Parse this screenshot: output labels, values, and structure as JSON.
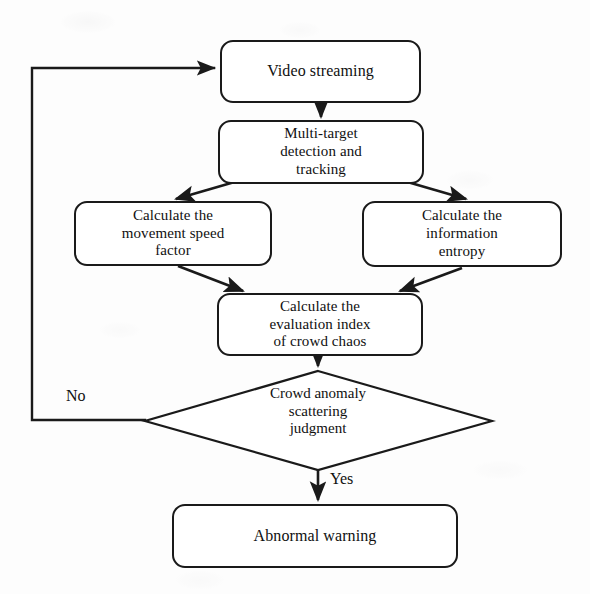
{
  "figure": {
    "type": "flowchart",
    "orientation": "top-to-bottom",
    "background_color": "#fdfdfd",
    "line_color": "#1a1a1a",
    "text_color": "#101010"
  },
  "nodes": {
    "video_streaming": {
      "label": "Video streaming",
      "shape": "rounded-rectangle",
      "font_size": "16px"
    },
    "multi_target": {
      "label": "Multi-target\ndetection and\ntracking",
      "shape": "rounded-rectangle",
      "font_size": "15px"
    },
    "movement_speed": {
      "label": "Calculate the\nmovement speed\nfactor",
      "shape": "rounded-rectangle",
      "font_size": "15px"
    },
    "information_entropy": {
      "label": "Calculate the\ninformation\nentropy",
      "shape": "rounded-rectangle",
      "font_size": "15px"
    },
    "evaluation_index": {
      "label": "Calculate the\nevaluation index\nof crowd chaos",
      "shape": "rounded-rectangle",
      "font_size": "15px"
    },
    "decision": {
      "label": "Crowd anomaly\nscattering\njudgment",
      "shape": "diamond",
      "font_size": "15px"
    },
    "abnormal_warning": {
      "label": "Abnormal warning",
      "shape": "rounded-rectangle",
      "font_size": "16px"
    }
  },
  "edge_labels": {
    "no_branch": "No",
    "yes_branch": "Yes"
  }
}
